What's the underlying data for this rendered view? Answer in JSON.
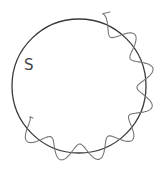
{
  "diagram": {
    "label": "S",
    "label_pos": [
      24,
      70
    ],
    "circle": {
      "cx": 79,
      "cy": 86,
      "r": 67,
      "color": "#3a3a3a",
      "stroke_width": 1.3
    },
    "wave": {
      "color": "#777777",
      "stroke_width": 1.1,
      "start_angle_deg": -72,
      "end_angle_deg": 148,
      "amplitude": 9,
      "cycles": 7.5,
      "phase_deg": 90,
      "start_lead": [
        110,
        12
      ],
      "end_lead": [
        33,
        118
      ]
    }
  }
}
